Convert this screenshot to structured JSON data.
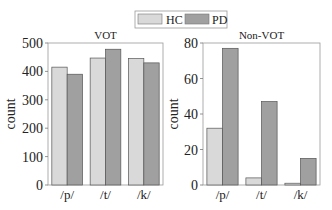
{
  "legend": {
    "items": [
      {
        "label": "HC",
        "color": "#d9d9d9"
      },
      {
        "label": "PD",
        "color": "#a0a0a0"
      }
    ],
    "placement": "top-center"
  },
  "chart_data": [
    {
      "type": "bar",
      "title": "VOT",
      "xlabel": "",
      "ylabel": "count",
      "categories": [
        "/p/",
        "/t/",
        "/k/"
      ],
      "series": [
        {
          "name": "HC",
          "values": [
            415,
            447,
            445
          ]
        },
        {
          "name": "PD",
          "values": [
            390,
            478,
            430
          ]
        }
      ],
      "ylim": [
        0,
        500
      ],
      "yticks": [
        0,
        100,
        200,
        300,
        400,
        500
      ],
      "grid": false
    },
    {
      "type": "bar",
      "title": "Non-VOT",
      "xlabel": "",
      "ylabel": "count",
      "categories": [
        "/p/",
        "/t/",
        "/k/"
      ],
      "series": [
        {
          "name": "HC",
          "values": [
            32,
            4,
            1
          ]
        },
        {
          "name": "PD",
          "values": [
            77,
            47,
            15
          ]
        }
      ],
      "ylim": [
        0,
        80
      ],
      "yticks": [
        0,
        20,
        40,
        60,
        80
      ],
      "grid": false
    }
  ]
}
